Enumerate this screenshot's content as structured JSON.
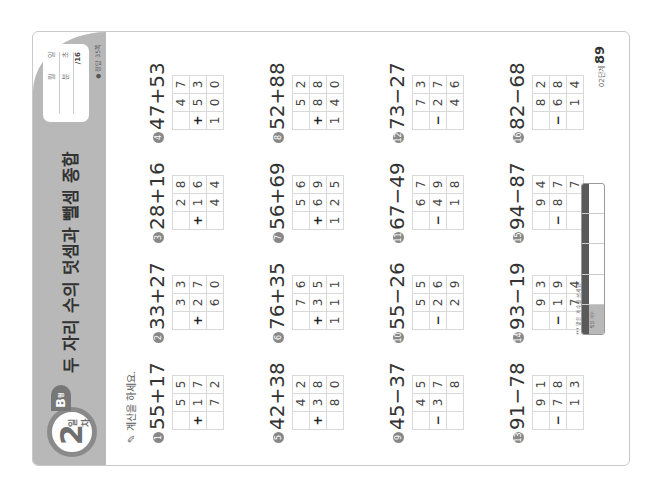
{
  "header": {
    "day_number": "2",
    "day_label": "일차",
    "level": "B",
    "level_suffix": "형",
    "title": "두 자리 수의 덧셈과 뺄셈 종합",
    "record": {
      "date_label_month": "월",
      "date_label_day": "일",
      "time_label_min": "분",
      "time_label_sec": "초",
      "score": "/16"
    },
    "answer_ref": "● 정답 35쪽"
  },
  "instruction": "✎ 계산을 하세요.",
  "problems": [
    {
      "num": "1",
      "label": "55+17",
      "op": "+",
      "top": [
        "",
        "5",
        "5"
      ],
      "mid": [
        "+",
        "1",
        "7"
      ],
      "res": [
        "",
        "7",
        "2"
      ]
    },
    {
      "num": "2",
      "label": "33+27",
      "op": "+",
      "top": [
        "",
        "3",
        "3"
      ],
      "mid": [
        "+",
        "2",
        "7"
      ],
      "res": [
        "",
        "6",
        "0"
      ]
    },
    {
      "num": "3",
      "label": "28+16",
      "op": "+",
      "top": [
        "",
        "2",
        "8"
      ],
      "mid": [
        "+",
        "1",
        "6"
      ],
      "res": [
        "",
        "4",
        "4"
      ]
    },
    {
      "num": "4",
      "label": "47+53",
      "op": "+",
      "top": [
        "",
        "4",
        "7"
      ],
      "mid": [
        "+",
        "5",
        "3"
      ],
      "res": [
        "1",
        "0",
        "0"
      ]
    },
    {
      "num": "5",
      "label": "42+38",
      "op": "+",
      "top": [
        "",
        "4",
        "2"
      ],
      "mid": [
        "+",
        "3",
        "8"
      ],
      "res": [
        "",
        "8",
        "0"
      ]
    },
    {
      "num": "6",
      "label": "76+35",
      "op": "+",
      "top": [
        "",
        "7",
        "6"
      ],
      "mid": [
        "+",
        "3",
        "5"
      ],
      "res": [
        "1",
        "1",
        "1"
      ]
    },
    {
      "num": "7",
      "label": "56+69",
      "op": "+",
      "top": [
        "",
        "5",
        "6"
      ],
      "mid": [
        "+",
        "6",
        "9"
      ],
      "res": [
        "1",
        "2",
        "5"
      ]
    },
    {
      "num": "8",
      "label": "52+88",
      "op": "+",
      "top": [
        "",
        "5",
        "2"
      ],
      "mid": [
        "+",
        "8",
        "8"
      ],
      "res": [
        "1",
        "4",
        "0"
      ]
    },
    {
      "num": "9",
      "label": "45−37",
      "op": "−",
      "top": [
        "",
        "4",
        "5"
      ],
      "mid": [
        "−",
        "3",
        "7"
      ],
      "res": [
        "",
        "",
        "8"
      ]
    },
    {
      "num": "10",
      "label": "55−26",
      "op": "−",
      "top": [
        "",
        "5",
        "5"
      ],
      "mid": [
        "−",
        "2",
        "6"
      ],
      "res": [
        "",
        "2",
        "9"
      ]
    },
    {
      "num": "11",
      "label": "67−49",
      "op": "−",
      "top": [
        "",
        "6",
        "7"
      ],
      "mid": [
        "−",
        "4",
        "9"
      ],
      "res": [
        "",
        "1",
        "8"
      ]
    },
    {
      "num": "12",
      "label": "73−27",
      "op": "−",
      "top": [
        "",
        "7",
        "3"
      ],
      "mid": [
        "−",
        "2",
        "7"
      ],
      "res": [
        "",
        "4",
        "6"
      ]
    },
    {
      "num": "13",
      "label": "91−78",
      "op": "−",
      "top": [
        "",
        "9",
        "1"
      ],
      "mid": [
        "−",
        "7",
        "8"
      ],
      "res": [
        "",
        "1",
        "3"
      ]
    },
    {
      "num": "14",
      "label": "93−19",
      "op": "−",
      "top": [
        "",
        "9",
        "3"
      ],
      "mid": [
        "−",
        "1",
        "9"
      ],
      "res": [
        "",
        "7",
        "4"
      ]
    },
    {
      "num": "15",
      "label": "94−87",
      "op": "−",
      "top": [
        "",
        "9",
        "4"
      ],
      "mid": [
        "−",
        "8",
        "7"
      ],
      "res": [
        "",
        "",
        "7"
      ]
    },
    {
      "num": "16",
      "label": "82−68",
      "op": "−",
      "top": [
        "",
        "8",
        "2"
      ],
      "mid": [
        "−",
        "6",
        "8"
      ],
      "res": [
        "",
        "1",
        "4"
      ]
    }
  ],
  "footer": {
    "stamp_text": "*** 맞은 개수를 쓰세요.",
    "table_cells": [
      "맞은 개수",
      "",
      "",
      "",
      ""
    ],
    "page_prefix": "02단계",
    "page_number": "89"
  }
}
